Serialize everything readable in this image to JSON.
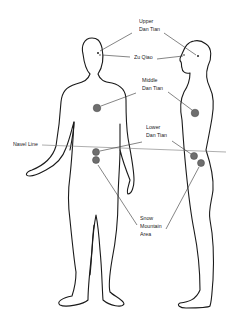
{
  "labels": {
    "upper_dan_tian": {
      "line1": "Upper",
      "line2": "Dan Tian"
    },
    "zu_qiao": "Zu Qiao",
    "middle_dan_tian": {
      "line1": "Middle",
      "line2": "Dan Tian"
    },
    "navel_line": "Navel Line",
    "lower_dan_tian": {
      "line1": "Lower",
      "line2": "Dan Tian"
    },
    "snow_mountain_area": {
      "line1": "Snow",
      "line2": "Mountain",
      "line3": "Area"
    }
  },
  "figures": [
    {
      "name": "front-view",
      "view": "front"
    },
    {
      "name": "side-view",
      "view": "profile"
    }
  ],
  "colors": {
    "outline": "#1a1a1a",
    "energy_center": "#6e6e6e",
    "navel_line": "#777777",
    "background": "#ffffff"
  }
}
